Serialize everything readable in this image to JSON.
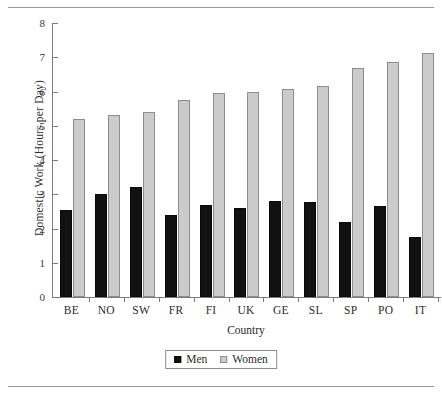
{
  "chart_data": {
    "type": "bar",
    "title": "",
    "xlabel": "Country",
    "ylabel": "Domestic Work (Hours per Day)",
    "categories": [
      "BE",
      "NO",
      "SW",
      "FR",
      "FI",
      "UK",
      "GE",
      "SL",
      "SP",
      "PO",
      "IT"
    ],
    "series": [
      {
        "name": "Men",
        "color": "#111111",
        "values": [
          2.55,
          3.02,
          3.2,
          2.4,
          2.68,
          2.6,
          2.8,
          2.77,
          2.2,
          2.67,
          1.75
        ]
      },
      {
        "name": "Women",
        "color": "#cbcbcb",
        "values": [
          5.2,
          5.3,
          5.4,
          5.75,
          5.95,
          6.0,
          6.08,
          6.17,
          6.68,
          6.85,
          7.13
        ]
      }
    ],
    "ylim": [
      0,
      8
    ],
    "ytick_labels": [
      "0",
      "1",
      "2",
      "3",
      "4",
      "5",
      "6",
      "7",
      "8"
    ],
    "ytick_values": [
      0,
      1,
      2,
      3,
      4,
      5,
      6,
      7,
      8
    ],
    "grid": false,
    "legend_position": "bottom-center",
    "legend_entries": [
      "Men",
      "Women"
    ]
  }
}
